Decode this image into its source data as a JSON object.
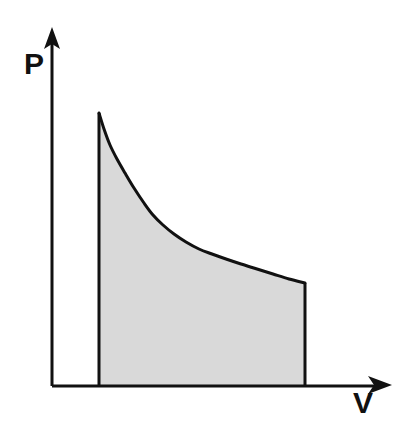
{
  "figure": {
    "name": "pressure-volume-diagram",
    "title": "",
    "background_color": "#ffffff",
    "width": 410,
    "height": 434
  },
  "axes": {
    "x_axis": {
      "label": "V",
      "label_full": "Volume",
      "arrow": true,
      "origin_px": [
        52,
        386
      ],
      "tip_px": [
        392,
        386
      ],
      "color": "#111111"
    },
    "y_axis": {
      "label": "P",
      "label_full": "Pressure",
      "arrow": true,
      "origin_px": [
        52,
        386
      ],
      "tip_px": [
        52,
        29
      ],
      "color": "#111111"
    }
  },
  "chart_data": {
    "type": "area",
    "title": "",
    "subtitle": "",
    "xlabel": "V",
    "ylabel": "P",
    "grid": false,
    "legend": null,
    "legend_position": "none",
    "axis_arrows": true,
    "tick_labels_x": [],
    "tick_labels_y": [],
    "xlim": [
      0,
      1
    ],
    "ylim": [
      0,
      1
    ],
    "series": [
      {
        "name": "isothermal-expansion-curve",
        "kind": "line",
        "stroke_color": "#111111",
        "stroke_width": 3,
        "fill_color": "#d9d9d9",
        "fill_to": "baseline",
        "comment": "pressure decreases as volume increases (P ~ 1/V)",
        "points_px": [
          [
            99,
            113
          ],
          [
            104,
            129
          ],
          [
            110,
            145
          ],
          [
            117,
            159
          ],
          [
            125,
            173
          ],
          [
            134,
            188
          ],
          [
            144,
            203
          ],
          [
            153,
            215
          ],
          [
            163,
            225
          ],
          [
            174,
            234
          ],
          [
            186,
            242
          ],
          [
            199,
            249
          ],
          [
            212,
            254
          ],
          [
            226,
            259
          ],
          [
            241,
            264
          ],
          [
            257,
            269
          ],
          [
            273,
            274
          ],
          [
            289,
            279
          ],
          [
            305,
            283
          ]
        ]
      }
    ],
    "shaded_region": {
      "name": "work-area",
      "fill_color": "#d9d9d9",
      "edge_color": "#111111",
      "left_boundary_x_px": 99,
      "right_boundary_x_px": 305,
      "baseline_y_px": 386,
      "top_left_px": [
        99,
        113
      ],
      "top_right_px": [
        305,
        283
      ],
      "bottom_left_px": [
        99,
        386
      ],
      "bottom_right_px": [
        305,
        386
      ],
      "meaning": "area under curve"
    },
    "annotations": []
  },
  "style": {
    "line_color": "#111111",
    "fill_color": "#d9d9d9",
    "label_color": "#111111",
    "line_width": 3,
    "axis_width": 3,
    "label_font_size": 30
  },
  "labels": {
    "pressure_label": "P",
    "volume_label": "V"
  }
}
